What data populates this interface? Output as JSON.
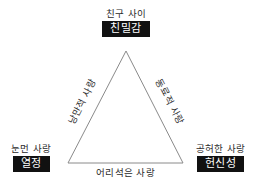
{
  "diagram": {
    "type": "triangle-concept-diagram",
    "background_color": "#ffffff",
    "stroke_color": "#8a8a8a",
    "box_fill_color": "#111111",
    "box_text_color": "#ffffff",
    "text_color": "#2b2b2b",
    "vertices": {
      "top": {
        "caption": "친구 사이",
        "box_label": "친밀감",
        "point": {
          "x": 126,
          "y": 51
        }
      },
      "bottom_left": {
        "caption": "눈먼 사랑",
        "box_label": "열정",
        "point": {
          "x": 68,
          "y": 163
        }
      },
      "bottom_right": {
        "caption": "공허한 사랑",
        "box_label": "헌신성",
        "point": {
          "x": 183,
          "y": 163
        }
      }
    },
    "edges": {
      "left": {
        "label": "낭만적 사랑",
        "rotation_deg": -62.5
      },
      "right": {
        "label": "동료적 사랑",
        "rotation_deg": 62.5
      },
      "bottom": {
        "label": "어리석은 사랑",
        "rotation_deg": 0
      }
    }
  }
}
